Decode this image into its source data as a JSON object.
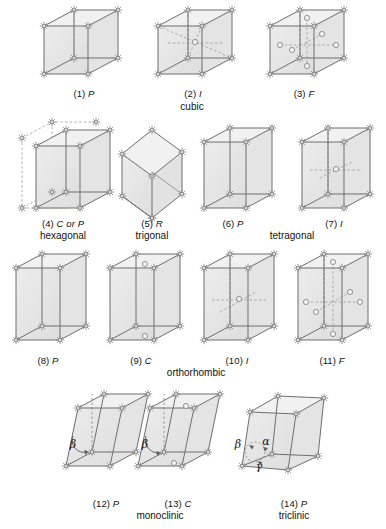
{
  "figure": {
    "background": "#ffffff",
    "stroke": "#6e6e6e",
    "face_fill": "#e8e8e8",
    "point_color": "#8a8a8a",
    "dash_color": "#9a9a9a"
  },
  "cells": [
    {
      "id": 1,
      "number": "(1)",
      "symbol": "P",
      "system": "cubic",
      "shape": "cube",
      "centering": "primitive"
    },
    {
      "id": 2,
      "number": "(2)",
      "symbol": "I",
      "system": "cubic",
      "shape": "cube",
      "centering": "body-centered"
    },
    {
      "id": 3,
      "number": "(3)",
      "symbol": "F",
      "system": "cubic",
      "shape": "cube",
      "centering": "face-centered"
    },
    {
      "id": 4,
      "number": "(4)",
      "symbol": "C or P",
      "system": "hexagonal",
      "shape": "prism",
      "centering": "hexagonal-extension"
    },
    {
      "id": 5,
      "number": "(5)",
      "symbol": "R",
      "system": "trigonal",
      "shape": "rhombohedron",
      "centering": "primitive"
    },
    {
      "id": 6,
      "number": "(6)",
      "symbol": "P",
      "system": "tetragonal",
      "shape": "prism",
      "centering": "primitive"
    },
    {
      "id": 7,
      "number": "(7)",
      "symbol": "I",
      "system": "tetragonal",
      "shape": "prism",
      "centering": "body-centered"
    },
    {
      "id": 8,
      "number": "(8)",
      "symbol": "P",
      "system": "orthorhombic",
      "shape": "prism",
      "centering": "primitive"
    },
    {
      "id": 9,
      "number": "(9)",
      "symbol": "C",
      "system": "orthorhombic",
      "shape": "prism",
      "centering": "base-centered"
    },
    {
      "id": 10,
      "number": "(10)",
      "symbol": "I",
      "system": "orthorhombic",
      "shape": "prism",
      "centering": "body-centered"
    },
    {
      "id": 11,
      "number": "(11)",
      "symbol": "F",
      "system": "orthorhombic",
      "shape": "prism",
      "centering": "face-centered"
    },
    {
      "id": 12,
      "number": "(12)",
      "symbol": "P",
      "system": "monoclinic",
      "shape": "oblique",
      "centering": "primitive"
    },
    {
      "id": 13,
      "number": "(13)",
      "symbol": "C",
      "system": "monoclinic",
      "shape": "oblique",
      "centering": "base-centered"
    },
    {
      "id": 14,
      "number": "(14)",
      "symbol": "P",
      "system": "triclinic",
      "shape": "triclinic",
      "centering": "primitive"
    }
  ],
  "system_labels": [
    {
      "text": "cubic",
      "x": 192,
      "y": 103
    },
    {
      "text": "hexagonal",
      "x": 63,
      "y": 232
    },
    {
      "text": "trigonal",
      "x": 152,
      "y": 232
    },
    {
      "text": "tetragonal",
      "x": 292,
      "y": 232
    },
    {
      "text": "orthorhombic",
      "x": 196,
      "y": 369
    },
    {
      "text": "monoclinic",
      "x": 160,
      "y": 512
    },
    {
      "text": "triclinic",
      "x": 294,
      "y": 512
    }
  ],
  "angle_labels": [
    {
      "symbol": "β",
      "x": 73,
      "y": 444,
      "cell": 12
    },
    {
      "symbol": "β",
      "x": 145,
      "y": 444,
      "cell": 13
    },
    {
      "symbol": "β",
      "x": 238,
      "y": 444,
      "cell": 14
    },
    {
      "symbol": "α",
      "x": 266,
      "y": 441,
      "cell": 14
    },
    {
      "symbol": "γ",
      "x": 259,
      "y": 465,
      "cell": 14
    }
  ]
}
